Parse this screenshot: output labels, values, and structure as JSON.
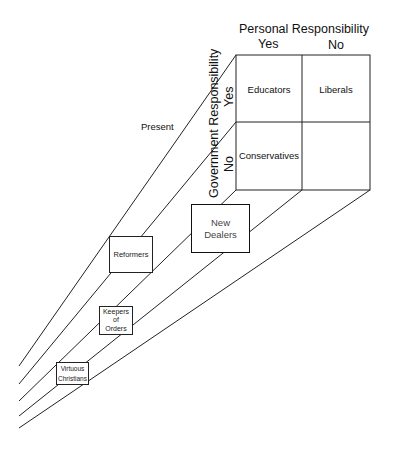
{
  "diagram": {
    "column_axis": {
      "title": "Personal Responsibility",
      "values": [
        "Yes",
        "No"
      ]
    },
    "row_axis": {
      "title": "Government Responsibility",
      "values": [
        "Yes",
        "No"
      ]
    },
    "cells": [
      {
        "row": "Yes",
        "col": "Yes",
        "label": "Educators"
      },
      {
        "row": "Yes",
        "col": "No",
        "label": "Liberals"
      },
      {
        "row": "No",
        "col": "Yes",
        "label": "Conservatives"
      },
      {
        "row": "No",
        "col": "No",
        "label": ""
      }
    ],
    "present_label": "Present",
    "historical_eras": [
      {
        "label_line1": "New",
        "label_line2": "Dealers"
      },
      {
        "label_line1": "Reformers",
        "label_line2": ""
      },
      {
        "label_line1": "Keepers",
        "label_line2": "of",
        "label_line3": "Orders"
      },
      {
        "label_line1": "Virtuous",
        "label_line2": "Christians"
      }
    ],
    "colors": {
      "line": "#222222",
      "background": "#ffffff"
    }
  }
}
